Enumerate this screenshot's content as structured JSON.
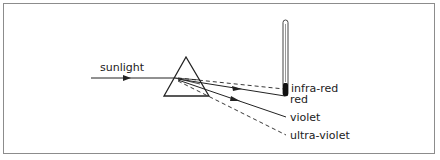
{
  "diagram": {
    "labels": {
      "sunlight": "sunlight",
      "infra_red": "infra-red",
      "red": "red",
      "violet": "violet",
      "ultra_violet": "ultra-violet"
    },
    "elements": {
      "incident_ray": "solid line with arrow pointing right",
      "prism": "triangular prism",
      "infra_red_ray": "dashed",
      "red_ray": "solid with arrow",
      "violet_ray": "solid with arrow",
      "ultra_violet_ray": "dashed",
      "thermometer": "vertical thermometer with dark bulb at infra-red position"
    },
    "colors": {
      "line": "#222222",
      "border": "#8c8c8c",
      "background": "#ffffff"
    }
  }
}
